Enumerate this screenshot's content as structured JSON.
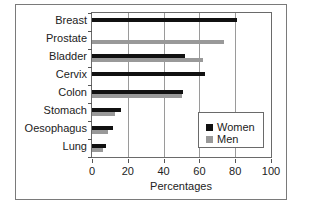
{
  "chart_data": {
    "type": "bar",
    "orientation": "horizontal",
    "title": "",
    "categories": [
      "Breast",
      "Prostate",
      "Bladder",
      "Cervix",
      "Colon",
      "Stomach",
      "Oesophagus",
      "Lung"
    ],
    "series": [
      {
        "name": "Women",
        "color": "#111111",
        "values": [
          81,
          null,
          52,
          63,
          51,
          16,
          12,
          8
        ]
      },
      {
        "name": "Men",
        "color": "#999999",
        "values": [
          null,
          74,
          62,
          null,
          50,
          13,
          9,
          6
        ]
      }
    ],
    "xlabel": "Percentages",
    "ylabel": "",
    "xlim": [
      0,
      100
    ],
    "xticks": [
      "0",
      "20",
      "40",
      "60",
      "80",
      "100"
    ],
    "grid": "vertical",
    "legend_position": "lower right inside"
  },
  "legend": {
    "women": "Women",
    "men": "Men"
  }
}
